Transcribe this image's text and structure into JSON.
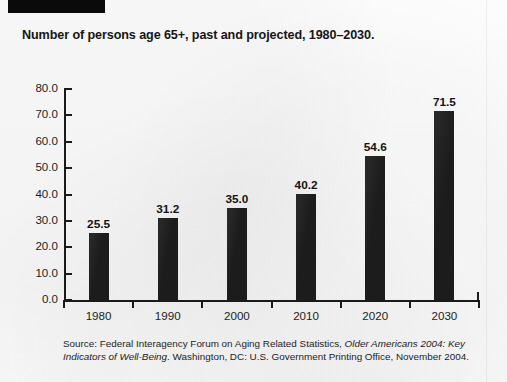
{
  "page": {
    "background_color": "#fbfbfb",
    "redaction_block": {
      "name": "redacted-header-block",
      "color": "#0a0a0a"
    }
  },
  "chart_title": "Number of persons age 65+, past and projected, 1980–2030.",
  "source": {
    "prefix": "Source: Federal Interagency Forum on Aging Related Statistics, ",
    "italic_title": "Older Americans 2004: Key Indicators of Well-Being",
    "suffix": ". Washington, DC: U.S. Government Printing Office, November 2004."
  },
  "chart_data": {
    "type": "bar",
    "title": "Number of persons age 65+, past and projected, 1980–2030.",
    "xlabel": "",
    "ylabel": "",
    "categories": [
      "1980",
      "1990",
      "2000",
      "2010",
      "2020",
      "2030"
    ],
    "values": [
      25.5,
      31.2,
      35.0,
      40.2,
      54.6,
      71.5
    ],
    "value_labels": [
      "25.5",
      "31.2",
      "35.0",
      "40.2",
      "54.6",
      "71.5"
    ],
    "ylim": [
      0.0,
      80.0
    ],
    "ytick_step": 10.0,
    "ytick_labels": [
      "80.0",
      "70.0",
      "60.0",
      "50.0",
      "40.0",
      "30.0",
      "20.0",
      "10.0",
      "0.0"
    ],
    "ytick_values": [
      80.0,
      70.0,
      60.0,
      50.0,
      40.0,
      30.0,
      20.0,
      10.0,
      0.0
    ],
    "grid": false,
    "legend": false,
    "bar_color": "#1c1c1c",
    "axis_color": "#1a1a1a"
  }
}
